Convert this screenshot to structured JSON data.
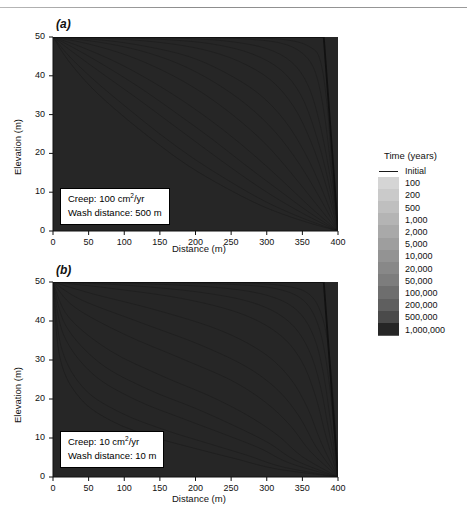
{
  "figure": {
    "panels": [
      {
        "label": "(a)",
        "annotation": {
          "line1_prefix": "Creep: 100 cm",
          "line1_sup": "2",
          "line1_suffix": "/yr",
          "line2": "Wash distance: 500 m",
          "creep_value": "100 cm2/yr",
          "wash_distance": "500 m"
        }
      },
      {
        "label": "(b)",
        "annotation": {
          "line1_prefix": "Creep: 10 cm",
          "line1_sup": "2",
          "line1_suffix": "/yr",
          "line2": "Wash distance: 10 m",
          "creep_value": "10 cm2/yr",
          "wash_distance": "10 m"
        }
      }
    ],
    "axes": {
      "xlabel": "Distance (m)",
      "ylabel": "Elevation (m)",
      "xticks": [
        "0",
        "50",
        "100",
        "150",
        "200",
        "250",
        "300",
        "350",
        "400"
      ],
      "yticks": [
        "0",
        "10",
        "20",
        "30",
        "40",
        "50"
      ],
      "xlim": [
        0,
        400
      ],
      "ylim": [
        0,
        50
      ]
    },
    "legend": {
      "title": "Time (years)",
      "initial_label": "Initial",
      "initial_color": "#1a1a1a",
      "entries": [
        {
          "label": "100",
          "color": "#d5d5d5"
        },
        {
          "label": "200",
          "color": "#cacaca"
        },
        {
          "label": "500",
          "color": "#bfbfbf"
        },
        {
          "label": "1,000",
          "color": "#b4b4b4"
        },
        {
          "label": "2,000",
          "color": "#a9a9a9"
        },
        {
          "label": "5,000",
          "color": "#9e9e9e"
        },
        {
          "label": "10,000",
          "color": "#939393"
        },
        {
          "label": "20,000",
          "color": "#888888"
        },
        {
          "label": "50,000",
          "color": "#7d7d7d"
        },
        {
          "label": "100,000",
          "color": "#6e6e6e"
        },
        {
          "label": "200,000",
          "color": "#5f5f5f"
        },
        {
          "label": "500,000",
          "color": "#4a4a4a"
        },
        {
          "label": "1,000,000",
          "color": "#262626"
        }
      ]
    }
  },
  "chart_data": {
    "type": "line",
    "xlabel": "Distance (m)",
    "ylabel": "Elevation (m)",
    "xlim": [
      0,
      400
    ],
    "ylim": [
      0,
      50
    ],
    "xticks": [
      0,
      50,
      100,
      150,
      200,
      250,
      300,
      350,
      400
    ],
    "yticks": [
      0,
      10,
      20,
      30,
      40,
      50
    ],
    "grid": false,
    "legend_position": "right",
    "legend_title": "Time (years)",
    "shading": "area between successive profiles filled with the band color of the later time",
    "panels": [
      {
        "name": "(a)",
        "creep_coefficient_cm2_per_yr": 100,
        "wash_distance_m": 500,
        "series": [
          {
            "name": "Initial",
            "years": 0,
            "x": [
              0,
              380,
              400
            ],
            "y": [
              50,
              50,
              0
            ]
          },
          {
            "name": "100",
            "years": 100,
            "x": [
              0,
              100,
              200,
              280,
              330,
              360,
              375,
              385,
              392,
              400
            ],
            "y": [
              50,
              50,
              50,
              49.8,
              49.2,
              47.5,
              44.0,
              32.0,
              15.0,
              0
            ]
          },
          {
            "name": "200",
            "years": 200,
            "x": [
              0,
              100,
              200,
              270,
              320,
              350,
              368,
              380,
              390,
              400
            ],
            "y": [
              50,
              50,
              49.9,
              49.5,
              48.4,
              45.8,
              41.0,
              31.0,
              16.5,
              0
            ]
          },
          {
            "name": "500",
            "years": 500,
            "x": [
              0,
              100,
              190,
              250,
              300,
              335,
              358,
              374,
              388,
              400
            ],
            "y": [
              50,
              49.9,
              49.6,
              48.8,
              47.0,
              43.5,
              37.5,
              28.0,
              15.0,
              0
            ]
          },
          {
            "name": "1,000",
            "years": 1000,
            "x": [
              0,
              90,
              170,
              230,
              280,
              320,
              348,
              368,
              385,
              400
            ],
            "y": [
              50,
              49.8,
              49.2,
              48.0,
              45.6,
              41.5,
              35.0,
              25.5,
              14.0,
              0
            ]
          },
          {
            "name": "2,000",
            "years": 2000,
            "x": [
              0,
              80,
              150,
              210,
              260,
              305,
              338,
              362,
              382,
              400
            ],
            "y": [
              50,
              49.6,
              48.6,
              46.8,
              43.8,
              39.0,
              32.0,
              23.0,
              12.5,
              0
            ]
          },
          {
            "name": "5,000",
            "years": 5000,
            "x": [
              0,
              70,
              130,
              190,
              240,
              288,
              325,
              354,
              378,
              400
            ],
            "y": [
              50,
              49.2,
              47.6,
              45.0,
              41.0,
              35.5,
              28.5,
              20.0,
              10.5,
              0
            ]
          },
          {
            "name": "10,000",
            "years": 10000,
            "x": [
              0,
              60,
              120,
              175,
              225,
              272,
              312,
              345,
              373,
              400
            ],
            "y": [
              50,
              48.8,
              46.6,
              43.2,
              38.5,
              32.5,
              25.5,
              17.5,
              9.0,
              0
            ]
          },
          {
            "name": "20,000",
            "years": 20000,
            "x": [
              0,
              50,
              105,
              158,
              208,
              255,
              298,
              334,
              367,
              400
            ],
            "y": [
              50,
              48.2,
              45.2,
              41.0,
              35.8,
              29.5,
              22.5,
              15.0,
              7.5,
              0
            ]
          },
          {
            "name": "50,000",
            "years": 50000,
            "x": [
              0,
              40,
              90,
              140,
              190,
              238,
              283,
              324,
              362,
              400
            ],
            "y": [
              50,
              47.4,
              43.4,
              38.4,
              32.6,
              26.2,
              19.4,
              12.6,
              6.0,
              0
            ]
          },
          {
            "name": "100,000",
            "years": 100000,
            "x": [
              0,
              35,
              80,
              128,
              176,
              224,
              270,
              315,
              358,
              400
            ],
            "y": [
              50,
              46.6,
              41.8,
              36.2,
              30.0,
              23.6,
              17.0,
              10.8,
              5.0,
              0
            ]
          },
          {
            "name": "200,000",
            "years": 200000,
            "x": [
              0,
              30,
              72,
              118,
              165,
              212,
              260,
              307,
              354,
              400
            ],
            "y": [
              50,
              45.8,
              40.2,
              34.2,
              27.8,
              21.4,
              15.0,
              9.2,
              4.2,
              0
            ]
          },
          {
            "name": "500,000",
            "years": 500000,
            "x": [
              0,
              25,
              62,
              105,
              150,
              198,
              248,
              298,
              349,
              400
            ],
            "y": [
              50,
              44.6,
              38.2,
              31.6,
              25.0,
              18.6,
              12.8,
              7.6,
              3.4,
              0
            ]
          },
          {
            "name": "1,000,000",
            "years": 1000000,
            "x": [
              0,
              22,
              55,
              96,
              142,
              190,
              242,
              294,
              347,
              400
            ],
            "y": [
              50,
              43.8,
              36.8,
              30.0,
              23.2,
              16.8,
              11.2,
              6.4,
              2.8,
              0
            ]
          }
        ]
      },
      {
        "name": "(b)",
        "creep_coefficient_cm2_per_yr": 10,
        "wash_distance_m": 10,
        "series": [
          {
            "name": "Initial",
            "years": 0,
            "x": [
              0,
              380,
              400
            ],
            "y": [
              50,
              50,
              0
            ]
          },
          {
            "name": "100",
            "years": 100,
            "x": [
              0,
              150,
              260,
              325,
              360,
              378,
              388,
              395,
              400
            ],
            "y": [
              50,
              50,
              49.8,
              49.0,
              46.8,
              41.0,
              31.0,
              16.0,
              0
            ]
          },
          {
            "name": "200",
            "years": 200,
            "x": [
              0,
              140,
              250,
              315,
              352,
              372,
              384,
              393,
              400
            ],
            "y": [
              50,
              49.9,
              49.4,
              48.2,
              45.2,
              39.0,
              29.0,
              15.0,
              0
            ]
          },
          {
            "name": "500",
            "years": 500,
            "x": [
              0,
              120,
              230,
              300,
              342,
              366,
              380,
              390,
              400
            ],
            "y": [
              50,
              49.6,
              48.6,
              46.6,
              42.8,
              36.0,
              26.0,
              13.5,
              0
            ]
          },
          {
            "name": "1,000",
            "years": 1000,
            "x": [
              0,
              100,
              205,
              282,
              330,
              358,
              375,
              387,
              400
            ],
            "y": [
              50,
              49.2,
              47.4,
              44.6,
              40.0,
              33.0,
              23.5,
              12.0,
              0
            ]
          },
          {
            "name": "2,000",
            "years": 2000,
            "x": [
              0,
              80,
              180,
              262,
              316,
              348,
              368,
              383,
              400
            ],
            "y": [
              50,
              48.4,
              45.8,
              42.0,
              36.8,
              30.0,
              21.0,
              10.5,
              0
            ]
          },
          {
            "name": "5,000",
            "years": 5000,
            "x": [
              0,
              55,
              145,
              232,
              294,
              332,
              357,
              376,
              400
            ],
            "y": [
              50,
              47.0,
              42.8,
              37.8,
              32.0,
              25.5,
              17.8,
              9.0,
              0
            ]
          },
          {
            "name": "10,000",
            "years": 10000,
            "x": [
              0,
              40,
              120,
              205,
              272,
              316,
              346,
              369,
              400
            ],
            "y": [
              50,
              45.4,
              39.8,
              34.0,
              28.2,
              22.2,
              15.4,
              7.8,
              0
            ]
          },
          {
            "name": "20,000",
            "years": 20000,
            "x": [
              0,
              30,
              100,
              180,
              250,
              298,
              333,
              361,
              400
            ],
            "y": [
              50,
              43.6,
              36.6,
              30.4,
              24.8,
              19.2,
              13.2,
              6.6,
              0
            ]
          },
          {
            "name": "50,000",
            "years": 50000,
            "x": [
              0,
              22,
              80,
              152,
              222,
              275,
              316,
              350,
              400
            ],
            "y": [
              50,
              41.0,
              32.4,
              26.0,
              20.6,
              15.6,
              10.6,
              5.2,
              0
            ]
          },
          {
            "name": "100,000",
            "years": 100000,
            "x": [
              0,
              18,
              66,
              132,
              200,
              256,
              302,
              341,
              400
            ],
            "y": [
              50,
              38.8,
              29.2,
              22.6,
              17.6,
              13.0,
              8.8,
              4.2,
              0
            ]
          },
          {
            "name": "200,000",
            "years": 200000,
            "x": [
              0,
              15,
              56,
              116,
              182,
              240,
              290,
              333,
              400
            ],
            "y": [
              50,
              36.4,
              26.4,
              19.8,
              15.0,
              11.0,
              7.4,
              3.5,
              0
            ]
          },
          {
            "name": "500,000",
            "years": 500000,
            "x": [
              0,
              12,
              44,
              96,
              158,
              218,
              272,
              322,
              400
            ],
            "y": [
              50,
              33.0,
              22.6,
              16.4,
              12.0,
              8.6,
              5.6,
              2.6,
              0
            ]
          },
          {
            "name": "1,000,000",
            "years": 1000000,
            "x": [
              0,
              10,
              38,
              84,
              142,
              202,
              258,
              313,
              400
            ],
            "y": [
              50,
              30.4,
              20.2,
              14.2,
              10.2,
              7.2,
              4.6,
              2.1,
              0
            ]
          }
        ]
      }
    ]
  }
}
